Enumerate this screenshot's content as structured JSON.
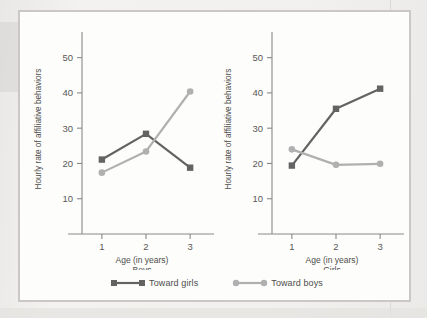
{
  "figure": {
    "y_axis_label": "Hourly rate of affiliative behaviors",
    "x_axis_label": "Age (in years)"
  },
  "legend": {
    "position": "bottom-center",
    "entries": [
      {
        "label": "Toward girls",
        "marker": "square",
        "color": "#636363"
      },
      {
        "label": "Toward boys",
        "marker": "circle",
        "color": "#b0b0b0"
      }
    ]
  },
  "colors": {
    "toward_girls": "#636363",
    "toward_boys": "#b0b0b0",
    "axis": "#8a8987",
    "frame": "#c9c8c6",
    "page": "#efeeec",
    "panel": "#fdfdfc"
  },
  "chart_data": [
    {
      "type": "line",
      "title": "Boys",
      "xlabel": "Age (in years)",
      "ylabel": "Hourly rate of affiliative behaviors",
      "x": [
        1,
        2,
        3
      ],
      "xticklabels": [
        "1",
        "2",
        "3"
      ],
      "yticks": [
        10,
        20,
        30,
        40,
        50
      ],
      "yticklabels": [
        "10",
        "20",
        "30",
        "40",
        "50"
      ],
      "ylim": [
        0,
        55
      ],
      "xlim": [
        0.55,
        3.45
      ],
      "grid": false,
      "series": [
        {
          "name": "Toward girls",
          "marker": "square",
          "color": "#636363",
          "values": [
            21.1,
            28.4,
            18.8
          ]
        },
        {
          "name": "Toward boys",
          "marker": "circle",
          "color": "#b0b0b0",
          "values": [
            17.4,
            23.4,
            40.4
          ]
        }
      ]
    },
    {
      "type": "line",
      "title": "Girls",
      "xlabel": "Age (in years)",
      "ylabel": "Hourly rate of affiliative behaviors",
      "x": [
        1,
        2,
        3
      ],
      "xticklabels": [
        "1",
        "2",
        "3"
      ],
      "yticks": [
        10,
        20,
        30,
        40,
        50
      ],
      "yticklabels": [
        "10",
        "20",
        "30",
        "40",
        "50"
      ],
      "ylim": [
        0,
        55
      ],
      "xlim": [
        0.55,
        3.45
      ],
      "grid": false,
      "series": [
        {
          "name": "Toward girls",
          "marker": "square",
          "color": "#636363",
          "values": [
            19.4,
            35.5,
            41.2
          ]
        },
        {
          "name": "Toward boys",
          "marker": "circle",
          "color": "#b0b0b0",
          "values": [
            24.0,
            19.6,
            19.9
          ]
        }
      ]
    }
  ]
}
